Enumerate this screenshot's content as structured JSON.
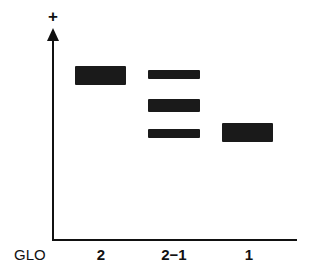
{
  "diagram": {
    "type": "gel-electrophoresis-schematic",
    "y_axis_symbol": "+",
    "row_label": "GLO",
    "lanes": [
      {
        "label": "2",
        "bands": [
          {
            "top": 66,
            "height": 19,
            "left": 75,
            "width": 51
          }
        ]
      },
      {
        "label": "2−1",
        "bands": [
          {
            "top": 70,
            "height": 9,
            "left": 148,
            "width": 52
          },
          {
            "top": 99,
            "height": 13,
            "left": 148,
            "width": 52
          },
          {
            "top": 129,
            "height": 9,
            "left": 148,
            "width": 52
          }
        ]
      },
      {
        "label": "1",
        "bands": [
          {
            "top": 123,
            "height": 19,
            "left": 222,
            "width": 51
          }
        ]
      }
    ],
    "colors": {
      "band": "#1a1a1a",
      "axis": "#111111",
      "background": "#ffffff"
    }
  }
}
